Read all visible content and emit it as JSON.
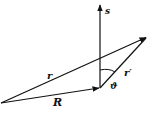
{
  "diagram": {
    "title": "",
    "labels": {
      "s": "s",
      "r": "r",
      "r_prime": "r′",
      "theta": "ϑ",
      "R": "R"
    },
    "vectors": [
      {
        "name": "R",
        "from": [
          1,
          103
        ],
        "to": [
          100,
          88
        ]
      },
      {
        "name": "r",
        "from": [
          1,
          103
        ],
        "to": [
          147,
          37
        ]
      },
      {
        "name": "r_prime",
        "from": [
          100,
          88
        ],
        "to": [
          147,
          37
        ]
      },
      {
        "name": "s",
        "from": [
          100,
          88
        ],
        "to": [
          100,
          5
        ]
      }
    ],
    "angle": {
      "name": "theta",
      "between": [
        "s",
        "r_prime"
      ],
      "vertex": [
        100,
        88
      ]
    },
    "color": "#111111"
  }
}
